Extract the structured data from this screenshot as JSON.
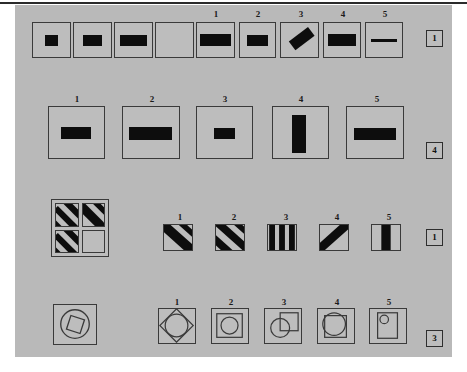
{
  "page": {
    "background_color": "#b9b9b9",
    "ink_color": "#0d0d0d",
    "border_color": "#3a3a3a"
  },
  "problems": [
    {
      "id": "problem-1",
      "prompt_label": "Series of squares with widening black bar; fourth is blank",
      "sequence": [
        {
          "label": "s1",
          "description": "small black square"
        },
        {
          "label": "s2",
          "description": "small horizontal black bar"
        },
        {
          "label": "s3",
          "description": "medium horizontal black bar"
        },
        {
          "label": "s4",
          "description": "blank - missing item"
        }
      ],
      "options": [
        {
          "number": "1",
          "description": "wide horizontal bar filling most of box"
        },
        {
          "number": "2",
          "description": "medium horizontal bar"
        },
        {
          "number": "3",
          "description": "diagonal tilted bar"
        },
        {
          "number": "4",
          "description": "wide thick horizontal bar"
        },
        {
          "number": "5",
          "description": "thin horizontal line"
        }
      ],
      "answer": "1"
    },
    {
      "id": "problem-2",
      "prompt_label": "Large squares containing horizontal bars of varying width",
      "sequence": [],
      "options": [
        {
          "number": "1",
          "description": "medium horizontal bar centered"
        },
        {
          "number": "2",
          "description": "wide horizontal bar"
        },
        {
          "number": "3",
          "description": "small horizontal bar"
        },
        {
          "number": "4",
          "description": "tall vertical bar"
        },
        {
          "number": "5",
          "description": "wide horizontal bar"
        }
      ],
      "answer": "4"
    },
    {
      "id": "problem-3",
      "prompt_label": "Two-by-two matrix of diagonally striped cells, bottom-right blank",
      "matrix": [
        {
          "cell": "top-left",
          "description": "two diagonal stripes"
        },
        {
          "cell": "top-right",
          "description": "one thick diagonal stripe"
        },
        {
          "cell": "bottom-left",
          "description": "two diagonal stripes"
        },
        {
          "cell": "bottom-right",
          "description": "blank - missing item"
        }
      ],
      "options": [
        {
          "number": "1",
          "description": "single thick diagonal stripe"
        },
        {
          "number": "2",
          "description": "two diagonal stripes"
        },
        {
          "number": "3",
          "description": "three vertical stripes"
        },
        {
          "number": "4",
          "description": "single backslash diagonal stripe"
        },
        {
          "number": "5",
          "description": "single vertical stripe"
        }
      ],
      "answer": "1"
    },
    {
      "id": "problem-4",
      "prompt_label": "Square containing circle with tilted square inside",
      "matrix": [
        {
          "cell": "single",
          "description": "circle enclosing a tilted square"
        }
      ],
      "options": [
        {
          "number": "1",
          "description": "square with inscribed diamond and circle"
        },
        {
          "number": "2",
          "description": "nested square containing a circle"
        },
        {
          "number": "3",
          "description": "circle overlapping a square"
        },
        {
          "number": "4",
          "description": "square with large overflowing circle"
        },
        {
          "number": "5",
          "description": "tall rectangle with small circle at top"
        }
      ],
      "answer": "3"
    }
  ]
}
